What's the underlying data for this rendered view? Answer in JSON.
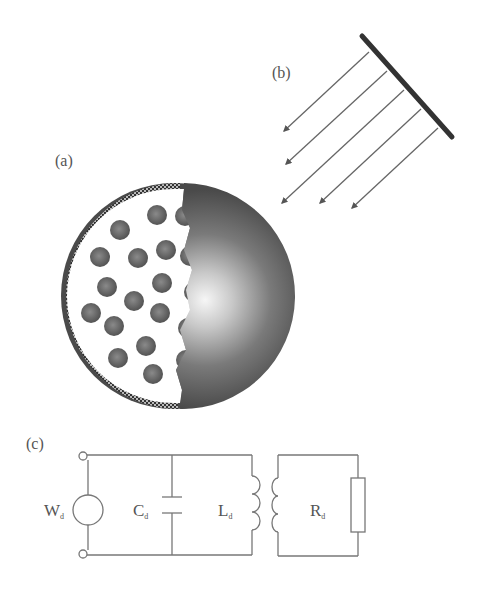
{
  "panels": {
    "a": {
      "label": "(a)",
      "description": "Sphere with cut-away showing embedded particles and checkered outer shell"
    },
    "b": {
      "label": "(b)",
      "description": "Plane wave incident on sphere, emitted from a plate"
    },
    "c": {
      "label": "(c)",
      "description": "Equivalent circuit"
    }
  },
  "circuit": {
    "source": {
      "symbol": "W",
      "subscript": "d"
    },
    "capacitor": {
      "symbol": "C",
      "subscript": "d"
    },
    "inductor": {
      "symbol": "L",
      "subscript": "d"
    },
    "resistor": {
      "symbol": "R",
      "subscript": "d"
    }
  },
  "colors": {
    "line": "#777777",
    "plate": "#333333",
    "sphere_dark": "#4a4a4a",
    "sphere_highlight": "#f4f4f4",
    "particle": "#5a5a5a",
    "shell": "#444444",
    "label": "#555555"
  }
}
